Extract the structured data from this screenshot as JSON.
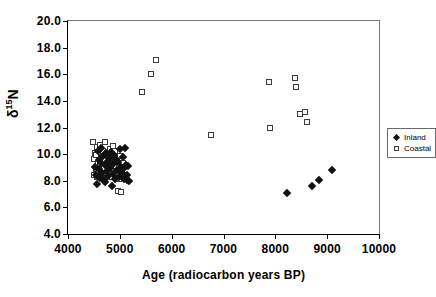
{
  "chart_data": {
    "type": "scatter",
    "title": "",
    "xlabel": "Age (radiocarbon years BP)",
    "ylabel": "δ¹⁵N",
    "ylabel_parts": {
      "symbol": "δ",
      "superscript": "15",
      "element": "N"
    },
    "xlim": [
      4000,
      10000
    ],
    "ylim": [
      4.0,
      20.0
    ],
    "xticks": [
      4000,
      5000,
      6000,
      7000,
      8000,
      9000,
      10000
    ],
    "xtick_labels": [
      "4000",
      "5000",
      "6000",
      "7000",
      "8000",
      "9000",
      "10000"
    ],
    "yticks": [
      4.0,
      6.0,
      8.0,
      10.0,
      12.0,
      14.0,
      16.0,
      18.0,
      20.0
    ],
    "ytick_labels": [
      "4.0",
      "6.0",
      "8.0",
      "10.0",
      "12.0",
      "14.0",
      "16.0",
      "18.0",
      "20.0"
    ],
    "grid": false,
    "legend_position": "right-outside",
    "colors": {
      "inland": "#111111",
      "coastal_edge": "#3a3a3a",
      "coastal_fill": "#ffffff",
      "axis": "#000000",
      "frame": "#7a7a7a"
    },
    "series": [
      {
        "name": "Inland",
        "marker": "filled-diamond",
        "points": [
          [
            4520,
            9.05
          ],
          [
            4545,
            8.45
          ],
          [
            4560,
            7.75
          ],
          [
            4575,
            10.25
          ],
          [
            4590,
            9.55
          ],
          [
            4600,
            8.9
          ],
          [
            4615,
            8.2
          ],
          [
            4630,
            9.3
          ],
          [
            4645,
            10.45
          ],
          [
            4660,
            8.6
          ],
          [
            4675,
            9.85
          ],
          [
            4690,
            8.05
          ],
          [
            4705,
            9.15
          ],
          [
            4720,
            7.9
          ],
          [
            4735,
            10.05
          ],
          [
            4750,
            8.75
          ],
          [
            4765,
            9.45
          ],
          [
            4780,
            8.35
          ],
          [
            4800,
            9.7
          ],
          [
            4815,
            8.95
          ],
          [
            4830,
            10.15
          ],
          [
            4845,
            7.6
          ],
          [
            4860,
            9.25
          ],
          [
            4875,
            8.5
          ],
          [
            4890,
            9.95
          ],
          [
            4905,
            8.15
          ],
          [
            4920,
            9.6
          ],
          [
            4940,
            8.8
          ],
          [
            4960,
            9.4
          ],
          [
            4980,
            8.25
          ],
          [
            5000,
            10.35
          ],
          [
            5020,
            9.0
          ],
          [
            5040,
            8.6
          ],
          [
            5060,
            9.75
          ],
          [
            5075,
            8.1
          ],
          [
            5090,
            8.95
          ],
          [
            5105,
            10.45
          ],
          [
            5115,
            9.2
          ],
          [
            5130,
            8.05
          ],
          [
            5145,
            8.45
          ],
          [
            5160,
            9.1
          ],
          [
            5175,
            8.0
          ],
          [
            8230,
            7.1
          ],
          [
            8710,
            7.6
          ],
          [
            8850,
            8.05
          ],
          [
            9090,
            8.8
          ]
        ]
      },
      {
        "name": "Coastal",
        "marker": "open-square",
        "points": [
          [
            4490,
            10.9
          ],
          [
            4500,
            8.45
          ],
          [
            4510,
            9.6
          ],
          [
            4520,
            10.05
          ],
          [
            4535,
            8.9
          ],
          [
            4545,
            9.95
          ],
          [
            4555,
            8.25
          ],
          [
            4565,
            10.55
          ],
          [
            4580,
            9.35
          ],
          [
            4595,
            8.7
          ],
          [
            4610,
            10.7
          ],
          [
            4625,
            9.15
          ],
          [
            4640,
            8.4
          ],
          [
            4655,
            9.8
          ],
          [
            4670,
            10.25
          ],
          [
            4685,
            8.95
          ],
          [
            4700,
            9.55
          ],
          [
            4715,
            10.9
          ],
          [
            4730,
            8.6
          ],
          [
            4745,
            9.25
          ],
          [
            4760,
            10.1
          ],
          [
            4775,
            8.85
          ],
          [
            4790,
            9.7
          ],
          [
            4810,
            10.4
          ],
          [
            4825,
            9.0
          ],
          [
            4840,
            8.3
          ],
          [
            4855,
            9.9
          ],
          [
            4870,
            10.6
          ],
          [
            4885,
            8.75
          ],
          [
            4900,
            9.45
          ],
          [
            4915,
            10.2
          ],
          [
            4930,
            8.55
          ],
          [
            4945,
            9.65
          ],
          [
            4960,
            7.25
          ],
          [
            4975,
            9.05
          ],
          [
            4990,
            8.15
          ],
          [
            5005,
            9.85
          ],
          [
            5020,
            7.15
          ],
          [
            5040,
            8.65
          ],
          [
            5060,
            9.3
          ],
          [
            5420,
            14.65
          ],
          [
            5600,
            16.05
          ],
          [
            5700,
            17.1
          ],
          [
            6750,
            11.4
          ],
          [
            7870,
            15.4
          ],
          [
            7890,
            12.0
          ],
          [
            8380,
            15.75
          ],
          [
            8390,
            15.05
          ],
          [
            8480,
            13.0
          ],
          [
            8580,
            13.2
          ],
          [
            8620,
            12.4
          ]
        ]
      }
    ]
  },
  "legend": {
    "items": [
      {
        "label": "Inland",
        "marker": "filled-diamond"
      },
      {
        "label": "Coastal",
        "marker": "open-square"
      }
    ]
  }
}
